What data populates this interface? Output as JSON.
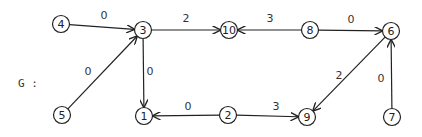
{
  "graph": {
    "label": "G :",
    "label_pos": [
      18,
      87
    ],
    "nodes": [
      {
        "id": "4",
        "x": 61,
        "y": 24
      },
      {
        "id": "3",
        "x": 143,
        "y": 30
      },
      {
        "id": "10",
        "x": 229,
        "y": 30
      },
      {
        "id": "8",
        "x": 310,
        "y": 30
      },
      {
        "id": "6",
        "x": 391,
        "y": 31
      },
      {
        "id": "5",
        "x": 62,
        "y": 115
      },
      {
        "id": "1",
        "x": 144,
        "y": 116
      },
      {
        "id": "2",
        "x": 228,
        "y": 115
      },
      {
        "id": "9",
        "x": 307,
        "y": 117
      },
      {
        "id": "7",
        "x": 392,
        "y": 117
      }
    ],
    "edges": [
      {
        "from": "4",
        "to": "3",
        "weight": "0",
        "lx": 104,
        "ly": 19
      },
      {
        "from": "5",
        "to": "3",
        "weight": "0",
        "lx": 88,
        "ly": 75
      },
      {
        "from": "3",
        "to": "10",
        "weight": "2",
        "lx": 186,
        "ly": 22
      },
      {
        "from": "8",
        "to": "10",
        "weight": "3",
        "lx": 270,
        "ly": 22
      },
      {
        "from": "8",
        "to": "6",
        "weight": "0",
        "lx": 351,
        "ly": 23
      },
      {
        "from": "3",
        "to": "1",
        "weight": "0",
        "lx": 150,
        "ly": 75
      },
      {
        "from": "2",
        "to": "1",
        "weight": "0",
        "lx": 188,
        "ly": 110
      },
      {
        "from": "2",
        "to": "9",
        "weight": "3",
        "lx": 276,
        "ly": 110
      },
      {
        "from": "6",
        "to": "9",
        "weight": "2",
        "lx": 339,
        "ly": 79
      },
      {
        "from": "7",
        "to": "6",
        "weight": "0",
        "lx": 381,
        "ly": 82
      }
    ]
  }
}
